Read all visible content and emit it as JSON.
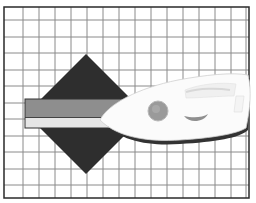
{
  "scene": {
    "description": "Grid background with dark diamond, horizontal striped bar and a white steam iron",
    "colors": {
      "background": "#ffffff",
      "grid_line": "#8a8a8a",
      "frame": "#2a2a2a",
      "diamond": "#2e2e2e",
      "bar_top": "#8e8e8e",
      "bar_bottom": "#e6e6e6",
      "bar_border": "#333333",
      "iron_body": "#fbfbfb",
      "iron_shadow": "#d8d8d8",
      "iron_dial": "#9a9a9a",
      "iron_soleplate": "#333333"
    },
    "grid": {
      "left": 4,
      "top": 7,
      "right": 249,
      "bottom": 198,
      "cell_width": 16,
      "cell_height": 16.5
    },
    "diamond": {
      "cx": 86,
      "cy": 114,
      "half_width": 60,
      "half_height": 60
    },
    "bar": {
      "x": 25,
      "y": 99,
      "width": 120,
      "height": 29,
      "split_y": 117
    },
    "iron": {
      "label": "steam-iron"
    }
  }
}
